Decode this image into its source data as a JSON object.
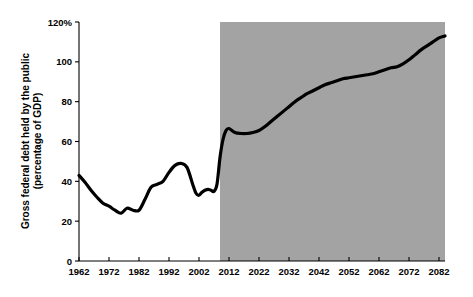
{
  "chart_data": {
    "type": "line",
    "title": "",
    "xlabel": "",
    "ylabel": "Gross federal debt held by the public (percentage of GDP)",
    "ylabel_line1": "Gross federal debt held by the public",
    "ylabel_line2": "(percentage of GDP)",
    "xlim": [
      1962,
      2084
    ],
    "ylim": [
      0,
      120
    ],
    "yticks": [
      0,
      20,
      40,
      60,
      80,
      100,
      120
    ],
    "ytick_labels": [
      "0",
      "20",
      "40",
      "60",
      "80",
      "100",
      "120%"
    ],
    "xticks": [
      1962,
      1972,
      1982,
      1992,
      2002,
      2012,
      2022,
      2032,
      2042,
      2052,
      2062,
      2072,
      2082
    ],
    "xtick_labels": [
      "1962",
      "1972",
      "1982",
      "1992",
      "2002",
      "2012",
      "2022",
      "2032",
      "2042",
      "2052",
      "2062",
      "2072",
      "2082"
    ],
    "grid": false,
    "legend": "none",
    "line_color": "#000000",
    "line_width": 3.2,
    "projection_shading": {
      "label": "projection-region",
      "color": "#a3a3a3",
      "x_start": 2009,
      "x_end": 2084
    },
    "series": [
      {
        "name": "Gross federal debt held by the public",
        "x": [
          1962,
          1964,
          1966,
          1968,
          1970,
          1972,
          1974,
          1976,
          1978,
          1980,
          1982,
          1984,
          1986,
          1988,
          1990,
          1992,
          1994,
          1996,
          1998,
          2000,
          2001,
          2002,
          2003,
          2004,
          2005,
          2006,
          2007,
          2008,
          2009,
          2010,
          2011,
          2012,
          2014,
          2016,
          2018,
          2020,
          2022,
          2024,
          2026,
          2028,
          2030,
          2032,
          2034,
          2036,
          2038,
          2040,
          2042,
          2044,
          2046,
          2048,
          2050,
          2052,
          2054,
          2056,
          2058,
          2060,
          2062,
          2064,
          2066,
          2068,
          2070,
          2072,
          2074,
          2076,
          2078,
          2080,
          2082,
          2084
        ],
        "y": [
          43.0,
          39.5,
          35.5,
          32.0,
          29.0,
          27.5,
          25.5,
          24.0,
          26.5,
          25.5,
          25.5,
          31.0,
          37.0,
          38.5,
          40.0,
          44.5,
          48.0,
          49.0,
          47.0,
          38.0,
          34.0,
          33.0,
          34.5,
          35.5,
          36.0,
          35.5,
          35.0,
          38.5,
          52.0,
          61.0,
          65.5,
          66.5,
          64.5,
          64.0,
          64.0,
          64.5,
          65.5,
          67.5,
          70.0,
          72.5,
          75.0,
          77.5,
          80.0,
          82.0,
          84.0,
          85.5,
          87.0,
          88.5,
          89.5,
          90.5,
          91.5,
          92.0,
          92.5,
          93.0,
          93.5,
          94.0,
          95.0,
          96.0,
          97.0,
          97.5,
          99.0,
          101.0,
          103.5,
          106.0,
          108.0,
          110.0,
          112.0,
          113.0
        ]
      }
    ]
  },
  "axes": {
    "y_axis_name": "y-axis",
    "x_axis_name": "x-axis"
  }
}
